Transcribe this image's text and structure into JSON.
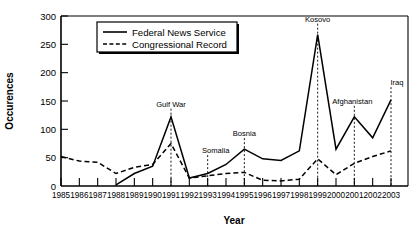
{
  "chart_data": {
    "type": "line",
    "title": "",
    "xlabel": "Year",
    "ylabel": "Occurences",
    "categories": [
      "1985",
      "1986",
      "1987",
      "1988",
      "1989",
      "1990",
      "1991",
      "1992",
      "1993",
      "1994",
      "1995",
      "1996",
      "1997",
      "1998",
      "1999",
      "2000",
      "2001",
      "2002",
      "2003"
    ],
    "x": [
      1985,
      1986,
      1987,
      1988,
      1989,
      1990,
      1991,
      1992,
      1993,
      1994,
      1995,
      1996,
      1997,
      1998,
      1999,
      2000,
      2001,
      2002,
      2003
    ],
    "ylim": [
      0,
      300
    ],
    "yticks": [
      0,
      50,
      100,
      150,
      200,
      250,
      300
    ],
    "grid": false,
    "legend_position": "top-center",
    "series": [
      {
        "name": "Federal News Service",
        "style": "solid",
        "values": [
          null,
          null,
          null,
          2,
          22,
          35,
          122,
          14,
          22,
          38,
          65,
          48,
          45,
          62,
          267,
          65,
          122,
          85,
          152
        ]
      },
      {
        "name": "Congressional Record",
        "style": "dashed",
        "values": [
          52,
          44,
          42,
          22,
          33,
          38,
          75,
          14,
          18,
          22,
          24,
          10,
          9,
          12,
          48,
          20,
          40,
          52,
          62
        ]
      }
    ],
    "annotations": [
      {
        "text": "Gulf War",
        "year": 1991,
        "label_value": 140
      },
      {
        "text": "Somalia",
        "year": 1993,
        "label_value": 58
      },
      {
        "text": "Bosnia",
        "year": 1995,
        "label_value": 88
      },
      {
        "text": "Kosovo",
        "year": 1999,
        "label_value": 290
      },
      {
        "text": "Afghanistan",
        "year": 2001,
        "label_value": 145
      },
      {
        "text": "Iraq",
        "year": 2003,
        "label_value": 178
      }
    ]
  },
  "axes": {
    "y_title": "Occurences",
    "x_title": "Year",
    "y_tick_labels": [
      "300",
      "250",
      "200",
      "150",
      "100",
      "50",
      "0"
    ],
    "x_tick_labels": [
      "1985",
      "1986",
      "1987",
      "1988",
      "1989",
      "1990",
      "1991",
      "1992",
      "1993",
      "1994",
      "1995",
      "1996",
      "1997",
      "1998",
      "1999",
      "2000",
      "2001",
      "2002",
      "2003"
    ]
  },
  "legend": {
    "entries": [
      {
        "label": "Federal News Service",
        "style": "solid"
      },
      {
        "label": "Congressional Record",
        "style": "dashed"
      }
    ]
  },
  "annotations": {
    "gulf_war": "Gulf War",
    "somalia": "Somalia",
    "bosnia": "Bosnia",
    "kosovo": "Kosovo",
    "afghanistan": "Afghanistan",
    "iraq": "Iraq"
  },
  "colors": {
    "ink": "#000000",
    "background": "#ffffff"
  }
}
